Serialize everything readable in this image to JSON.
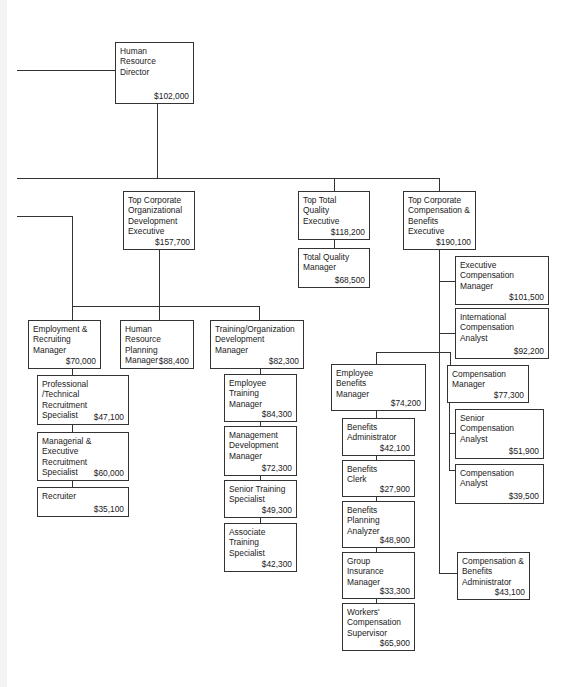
{
  "chart": {
    "type": "org_chart",
    "nodes": {
      "hr_director": {
        "title": "Human\nResource\nDirector",
        "salary": "$102,000"
      },
      "top_org_dev": {
        "title": "Top Corporate\nOrganizational\nDevelopment\nExecutive",
        "salary": "$157,700"
      },
      "top_quality": {
        "title": "Top Total\nQuality\nExecutive",
        "salary": "$118,200"
      },
      "quality_mgr": {
        "title": "Total Quality\nManager",
        "salary": "$68,500"
      },
      "top_comp": {
        "title": "Top Corporate\nCompensation &\nBenefits\nExecutive",
        "salary": "$190,100"
      },
      "exec_comp_mgr": {
        "title": "Executive\nCompensation\nManager",
        "salary": "$101,500"
      },
      "intl_comp": {
        "title": "International\nCompensation\nAnalyst",
        "salary": "$92,200"
      },
      "emp_recruit_mgr": {
        "title": "Employment &\nRecruiting\nManager",
        "salary": "$70,000"
      },
      "hr_planning_mgr": {
        "title": "Human Resource\nPlanning Manager",
        "salary": "$88,400"
      },
      "training_org_mgr": {
        "title": "Training/Organization\nDevelopment Manager",
        "salary": "$82,300"
      },
      "prof_tech": {
        "title": "Professional /Technical\nRecruitment\nSpecialist",
        "salary": "$47,100"
      },
      "mgr_exec_recruit": {
        "title": "Managerial &\nExecutive Recruitment\nSpecialist",
        "salary": "$60,000"
      },
      "recruiter": {
        "title": "Recruiter",
        "salary": "$35,100"
      },
      "emp_training_mgr": {
        "title": "Employee\nTraining\nManager",
        "salary": "$84,300"
      },
      "mgmt_dev_mgr": {
        "title": "Management\nDevelopment\nManager",
        "salary": "$72,300"
      },
      "senior_training": {
        "title": "Senior Training\nSpecialist",
        "salary": "$49,300"
      },
      "assoc_training": {
        "title": "Associate\nTraining\nSpecialist",
        "salary": "$42,300"
      },
      "emp_benefits_mgr": {
        "title": "Employee\nBenefits\n Manager",
        "salary": "$74,200"
      },
      "benefits_admin": {
        "title": "Benefits\nAdministrator",
        "salary": "$42,100"
      },
      "benefits_clerk": {
        "title": "Benefits\nClerk",
        "salary": "$27,900"
      },
      "benefits_planning": {
        "title": "Benefits\nPlanning\nAnalyzer",
        "salary": "$48,900"
      },
      "group_insurance": {
        "title": "Group\nInsurance\nManager",
        "salary": "$33,300"
      },
      "workers_comp": {
        "title": "Workers'\nCompensation\nSupervisor",
        "salary": "$65,900"
      },
      "comp_mgr": {
        "title": "Compensation\nManager",
        "salary": "$77,300"
      },
      "senior_comp": {
        "title": "Senior\nCompensation\nAnalyst",
        "salary": "$51,900"
      },
      "comp_analyst": {
        "title": "Compensation\nAnalyst",
        "salary": "$39,500"
      },
      "comp_benefits_admin": {
        "title": "Compensation &\nBenefits\nAdministrator",
        "salary": "$43,100"
      }
    }
  }
}
